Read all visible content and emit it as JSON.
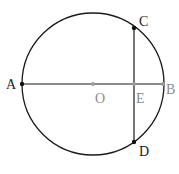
{
  "diagram": {
    "colors": {
      "stroke": "#1a1a1a",
      "point_dark": "#111111",
      "point_gray": "#9a9a9a",
      "label_dark": "#222222",
      "label_gray": "#8c8c8c"
    },
    "circle": {
      "center": "O",
      "cx": 93,
      "cy": 84,
      "r": 71
    },
    "points": [
      {
        "name": "A",
        "x": 22,
        "y": 84,
        "label": "A",
        "lx": 6,
        "ly": 89,
        "style": "dark"
      },
      {
        "name": "B",
        "x": 163,
        "y": 84,
        "label": "B",
        "lx": 166,
        "ly": 94,
        "style": "gray"
      },
      {
        "name": "C",
        "x": 134,
        "y": 28,
        "label": "C",
        "lx": 139,
        "ly": 26,
        "style": "dark"
      },
      {
        "name": "D",
        "x": 134,
        "y": 142,
        "label": "D",
        "lx": 139,
        "ly": 156,
        "style": "dark"
      },
      {
        "name": "O",
        "x": 93,
        "y": 84,
        "label": "O",
        "lx": 95,
        "ly": 103,
        "style": "gray"
      },
      {
        "name": "E",
        "x": 134,
        "y": 84,
        "label": "E",
        "lx": 136,
        "ly": 103,
        "style": "gray"
      }
    ],
    "segments": [
      {
        "from": "A",
        "to": "B",
        "name": "diameter-AB"
      },
      {
        "from": "C",
        "to": "D",
        "name": "chord-CD"
      }
    ]
  }
}
